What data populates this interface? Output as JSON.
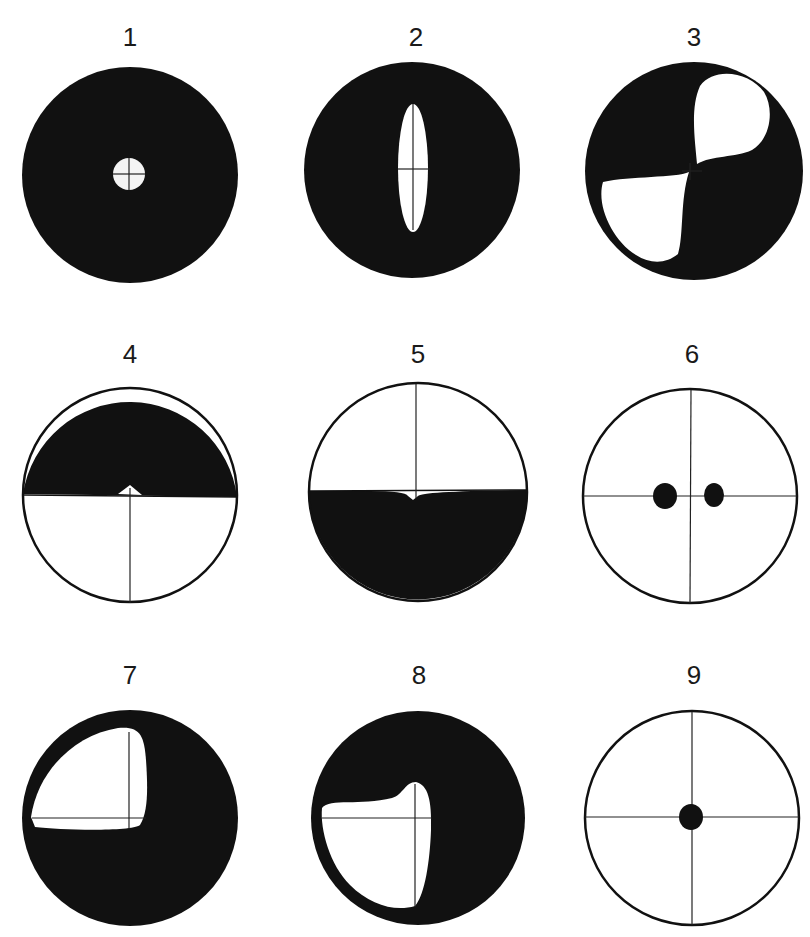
{
  "figure": {
    "colors": {
      "ink": "#111111",
      "background": "#ffffff"
    },
    "panels": [
      {
        "id": 1,
        "label": "1",
        "description": "Dark field with small bright circular hole and crosshair at center"
      },
      {
        "id": 2,
        "label": "2",
        "description": "Dark field with vertical elongated bright slit and crosshair"
      },
      {
        "id": 3,
        "label": "3",
        "description": "Dark field with two bright lobes in opposite quadrants (upper-right and lower-left)"
      },
      {
        "id": 4,
        "label": "4",
        "description": "Upper half dark, lower half bright with vertical crosshair and small notch"
      },
      {
        "id": 5,
        "label": "5",
        "description": "Upper half bright with vertical crosshair, lower half dark with small notch"
      },
      {
        "id": 6,
        "label": "6",
        "description": "Bright field with crosshair and two dark spots on horizontal axis"
      },
      {
        "id": 7,
        "label": "7",
        "description": "Dark field with bright rounded region in upper-left quadrant"
      },
      {
        "id": 8,
        "label": "8",
        "description": "Dark field with bright region in lower-left, crosshair"
      },
      {
        "id": 9,
        "label": "9",
        "description": "Bright field with crosshair and single dark spot at center"
      }
    ]
  }
}
